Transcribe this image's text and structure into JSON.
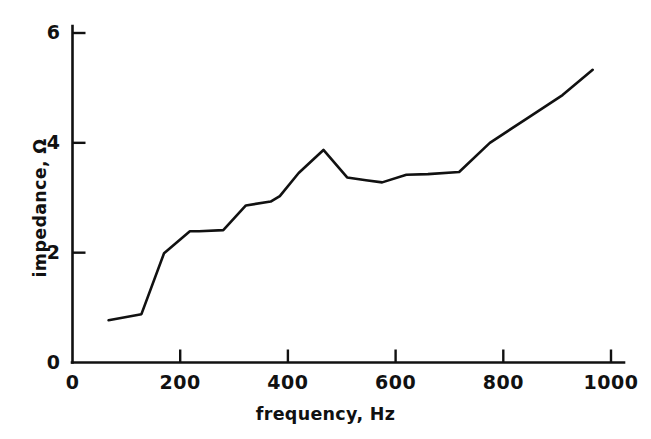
{
  "chart_data": {
    "type": "line",
    "title": "",
    "xlabel": "frequency, Hz",
    "ylabel": "impedance, Ω",
    "xlim": [
      0,
      1005
    ],
    "ylim": [
      0,
      6.3
    ],
    "xticks": [
      0,
      200,
      400,
      600,
      800,
      1000
    ],
    "xtick_labels": [
      "0",
      "200",
      "400",
      "600",
      "800",
      "1000"
    ],
    "yticks": [
      0,
      2,
      4,
      6
    ],
    "ytick_labels": [
      "0",
      "2",
      "4",
      "6"
    ],
    "grid": false,
    "legend": null,
    "line_color": "#111111",
    "line_width": 2.6,
    "series": [
      {
        "name": "impedance",
        "x": [
          67,
          128,
          170,
          218,
          235,
          280,
          322,
          368,
          385,
          420,
          466,
          510,
          545,
          575,
          620,
          660,
          718,
          775,
          845,
          910,
          966
        ],
        "y": [
          0.77,
          0.88,
          1.99,
          2.39,
          2.39,
          2.41,
          2.86,
          2.93,
          3.03,
          3.45,
          3.87,
          3.37,
          3.32,
          3.28,
          3.42,
          3.43,
          3.47,
          4.0,
          4.45,
          4.87,
          5.33
        ]
      }
    ]
  },
  "axes": {
    "x_axis_name": "x-axis",
    "y_axis_name": "y-axis"
  }
}
